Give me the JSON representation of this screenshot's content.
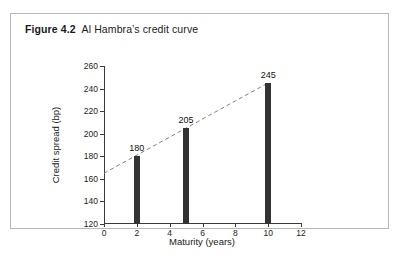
{
  "caption": {
    "label": "Figure 4.2",
    "text": "Al Hambra’s credit curve"
  },
  "chart_data": {
    "type": "bar",
    "title": "Al Hambra’s credit curve",
    "xlabel": "Maturity (years)",
    "ylabel": "Credit spread (bp)",
    "x": [
      2,
      5,
      10
    ],
    "values": [
      180,
      205,
      245
    ],
    "point_labels": [
      "180",
      "205",
      "245"
    ],
    "xlim": [
      0,
      12
    ],
    "ylim": [
      120,
      260
    ],
    "xticks": [
      0,
      2,
      4,
      6,
      8,
      10,
      12
    ],
    "xtick_labels": [
      "0",
      "2",
      "4",
      "6",
      "8",
      "10",
      "12"
    ],
    "yticks": [
      120,
      140,
      160,
      180,
      200,
      220,
      240,
      260
    ],
    "ytick_labels": [
      "120",
      "140",
      "160",
      "180",
      "200",
      "220",
      "240",
      "260"
    ],
    "grid": false,
    "legend": null,
    "series": [
      {
        "name": "Credit spread",
        "type": "bar",
        "color": "#333333",
        "points": [
          {
            "x": 2,
            "y": 180,
            "label": "180"
          },
          {
            "x": 5,
            "y": 205,
            "label": "205"
          },
          {
            "x": 10,
            "y": 245,
            "label": "245"
          }
        ]
      },
      {
        "name": "Credit curve trend",
        "type": "line",
        "style": "dashed",
        "color": "#808080",
        "points": [
          {
            "x": 0,
            "y": 165
          },
          {
            "x": 10,
            "y": 245
          }
        ]
      }
    ]
  },
  "colors": {
    "bar": "#333333",
    "trend_line": "#808080",
    "axis": "#3a3a3a",
    "frame_border": "#b8b8b8",
    "background": "#ffffff"
  }
}
